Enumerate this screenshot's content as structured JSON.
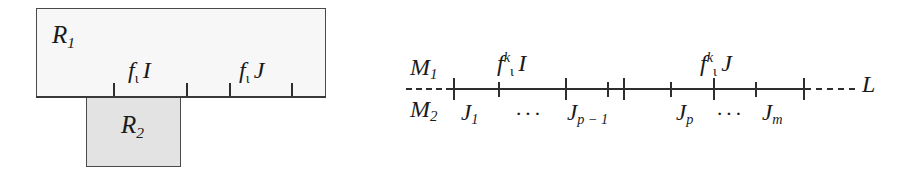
{
  "figure": {
    "name": "two-part-mathematical-diagram",
    "background_color": "#ffffff",
    "ink_color": "#1a1a1a"
  },
  "left_diagram": {
    "name": "rectangle-pair-diagram",
    "boxes": [
      {
        "id": "R1",
        "label": "R",
        "subscript": "1",
        "fill": "#f7f7f7",
        "stroke": "#4a4a4a"
      },
      {
        "id": "R2",
        "label": "R",
        "subscript": "2",
        "fill": "#e3e3e3",
        "stroke": "#4a4a4a"
      }
    ],
    "interval_labels": [
      {
        "id": "fI",
        "base": "f",
        "sub": "ι",
        "operand": "I"
      },
      {
        "id": "fJ",
        "base": "f",
        "sub": "ι",
        "operand": "J"
      }
    ],
    "tick_positions_px": [
      113,
      186,
      229,
      291
    ]
  },
  "right_diagram": {
    "name": "number-line-diagram",
    "left_endpoint_labels": {
      "upper": {
        "base": "M",
        "sub": "1"
      },
      "lower": {
        "base": "M",
        "sub": "2"
      }
    },
    "right_endpoint_label": {
      "base": "L"
    },
    "above_line_labels": [
      {
        "id": "fkI",
        "base": "f",
        "sub": "ι",
        "sup": "k",
        "operand": "I"
      },
      {
        "id": "fkJ",
        "base": "f",
        "sub": "ι",
        "sup": "k",
        "operand": "J"
      }
    ],
    "below_line_labels": [
      {
        "id": "J1",
        "base": "J",
        "sub": "1"
      },
      {
        "id": "Jp-1",
        "base": "J",
        "sub": "p − 1"
      },
      {
        "id": "Jp",
        "base": "J",
        "sub": "p"
      },
      {
        "id": "Jm",
        "base": "J",
        "sub": "m"
      }
    ],
    "ellipses": [
      "···",
      "···"
    ],
    "major_tick_positions_px": [
      453,
      565,
      623,
      713,
      803
    ],
    "minor_tick_positions_px": [
      498,
      607,
      670,
      755
    ],
    "dashes": {
      "left": "dashed-lead-in",
      "right": "dashed-lead-out"
    }
  }
}
